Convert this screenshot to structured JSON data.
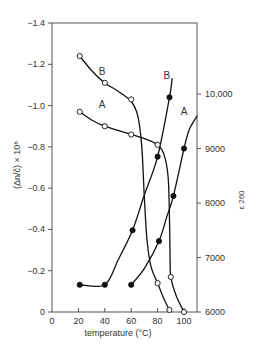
{
  "chart_data": {
    "type": "line",
    "title": "",
    "xlabel": "temperature (°C)",
    "ylabel_left": "(Δn/ĉ) × 10⁸",
    "ylabel_right": "ε 260",
    "xlim": [
      0,
      110
    ],
    "ylim_left": [
      0,
      -1.4
    ],
    "ylim_right": [
      6000,
      11000
    ],
    "x_ticks": [
      0,
      20,
      40,
      60,
      80,
      100
    ],
    "y_left_ticks": [
      0,
      -0.2,
      -0.4,
      -0.6,
      -0.8,
      -1.0,
      -1.2,
      -1.4
    ],
    "y_left_tick_labels": [
      "0",
      "−0.2",
      "−0.4",
      "−0.6",
      "−0.8",
      "−1.0",
      "−1.2",
      "−1.4"
    ],
    "y_right_ticks": [
      6000,
      7000,
      8000,
      9000,
      10000
    ],
    "y_right_tick_labels": [
      "6000",
      "7000",
      "8000",
      "9000",
      "10,000"
    ],
    "grid": false,
    "series": [
      {
        "name": "B (birefringence, open)",
        "label": "B",
        "axis": "left",
        "marker": "open-circle",
        "points": [
          [
            21,
            -1.24
          ],
          [
            40,
            -1.11
          ],
          [
            60,
            -1.03
          ],
          [
            80,
            -0.14
          ],
          [
            89,
            -0.01
          ]
        ],
        "curve": [
          [
            21,
            -1.24
          ],
          [
            30,
            -1.17
          ],
          [
            40,
            -1.11
          ],
          [
            50,
            -1.07
          ],
          [
            60,
            -1.02
          ],
          [
            65,
            -0.95
          ],
          [
            68,
            -0.8
          ],
          [
            70,
            -0.55
          ],
          [
            72,
            -0.35
          ],
          [
            75,
            -0.22
          ],
          [
            80,
            -0.14
          ],
          [
            85,
            -0.06
          ],
          [
            89,
            -0.01
          ]
        ]
      },
      {
        "name": "A (birefringence, open)",
        "label": "A",
        "axis": "left",
        "marker": "open-circle",
        "points": [
          [
            21,
            -0.97
          ],
          [
            40,
            -0.9
          ],
          [
            60,
            -0.86
          ],
          [
            80,
            -0.81
          ],
          [
            90,
            -0.17
          ],
          [
            100,
            0
          ]
        ],
        "curve": [
          [
            21,
            -0.97
          ],
          [
            30,
            -0.93
          ],
          [
            40,
            -0.9
          ],
          [
            50,
            -0.88
          ],
          [
            60,
            -0.86
          ],
          [
            70,
            -0.84
          ],
          [
            80,
            -0.81
          ],
          [
            85,
            -0.76
          ],
          [
            88,
            -0.65
          ],
          [
            89,
            -0.45
          ],
          [
            89.5,
            -0.25
          ],
          [
            90,
            -0.17
          ],
          [
            94,
            -0.08
          ],
          [
            100,
            0
          ]
        ]
      },
      {
        "name": "B (ε260, filled)",
        "label": "B",
        "axis": "right",
        "marker": "filled-circle",
        "points": [
          [
            21,
            6500
          ],
          [
            40,
            6500
          ],
          [
            61,
            7500
          ],
          [
            80,
            8850
          ],
          [
            89,
            9940
          ]
        ],
        "curve": [
          [
            21,
            6500
          ],
          [
            40,
            6500
          ],
          [
            50,
            6950
          ],
          [
            61,
            7500
          ],
          [
            70,
            8150
          ],
          [
            80,
            8850
          ],
          [
            89,
            9940
          ],
          [
            91,
            10290
          ]
        ]
      },
      {
        "name": "A (ε260, filled)",
        "label": "A",
        "axis": "right",
        "marker": "filled-circle",
        "points": [
          [
            60,
            6500
          ],
          [
            81,
            7300
          ],
          [
            92,
            8130
          ],
          [
            100,
            9000
          ]
        ],
        "curve": [
          [
            60,
            6500
          ],
          [
            70,
            6800
          ],
          [
            81,
            7300
          ],
          [
            87,
            7750
          ],
          [
            92,
            8130
          ],
          [
            100,
            9000
          ],
          [
            104,
            9350
          ],
          [
            110,
            9600
          ]
        ]
      }
    ],
    "annotations": [
      {
        "text": "B",
        "x": 38,
        "y": -1.15,
        "axis": "left"
      },
      {
        "text": "A",
        "x": 38,
        "y": -0.99,
        "axis": "left"
      },
      {
        "text": "B",
        "x": 87,
        "y": 10280,
        "axis": "right"
      },
      {
        "text": "A",
        "x": 100,
        "y": 9620,
        "axis": "right"
      }
    ]
  }
}
